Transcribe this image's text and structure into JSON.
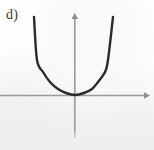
{
  "figure": {
    "label": "d)",
    "kind": "cartesian-plot",
    "background_color": "#fbfbfa",
    "axis_color": "#9a9a9e",
    "curve_color": "#2b2b2d",
    "label_color": "#3a3a3c"
  },
  "axes": {
    "x_axis": {
      "name": "x-axis",
      "y_pixel": 95,
      "x_start_pixel": 0,
      "x_end_pixel": 149,
      "arrow": "right",
      "stroke_width": 1.6,
      "tick_labels": [],
      "label": ""
    },
    "y_axis": {
      "name": "y-axis",
      "x_pixel": 75,
      "y_top_pixel": 14,
      "y_bottom_pixel": 137,
      "arrow": "up",
      "stroke_width": 1.6,
      "tick_labels": [],
      "label": ""
    },
    "origin_pixel": [
      75,
      95
    ]
  },
  "chart_data": {
    "type": "line",
    "title": "d)",
    "xlabel": "",
    "ylabel": "",
    "grid": false,
    "legend": null,
    "legend_position": "none",
    "axis_arrows": [
      "right",
      "up"
    ],
    "xlim": [
      -2.0,
      2.0
    ],
    "ylim": [
      -1.0,
      2.3
    ],
    "series": [
      {
        "name": "parabola",
        "shape": "upward-opening parabola",
        "vertex": [
          0,
          0
        ],
        "equation": "y = x^2",
        "stroke_color": "#2b2b2d",
        "stroke_width": 2.4,
        "x": [
          -1.12,
          -1.05,
          -0.95,
          -0.85,
          -0.75,
          -0.65,
          -0.55,
          -0.45,
          -0.35,
          -0.25,
          -0.15,
          0.0,
          0.15,
          0.25,
          0.35,
          0.45,
          0.55,
          0.65,
          0.75,
          0.85,
          0.95,
          1.05,
          1.12
        ],
        "values": [
          1.25,
          1.1,
          0.9,
          0.72,
          0.56,
          0.42,
          0.3,
          0.2,
          0.12,
          0.06,
          0.02,
          0.0,
          0.02,
          0.06,
          0.12,
          0.2,
          0.3,
          0.42,
          0.56,
          0.72,
          0.9,
          1.1,
          1.25
        ],
        "pixel_path": [
          [
            34,
            17
          ],
          [
            37,
            60
          ],
          [
            43,
            72
          ],
          [
            50,
            82
          ],
          [
            58,
            89
          ],
          [
            66,
            93
          ],
          [
            75,
            95
          ],
          [
            84,
            93
          ],
          [
            92,
            89
          ],
          [
            98,
            82
          ],
          [
            105,
            72
          ],
          [
            108,
            60
          ],
          [
            113,
            17
          ]
        ]
      }
    ],
    "annotations": []
  }
}
